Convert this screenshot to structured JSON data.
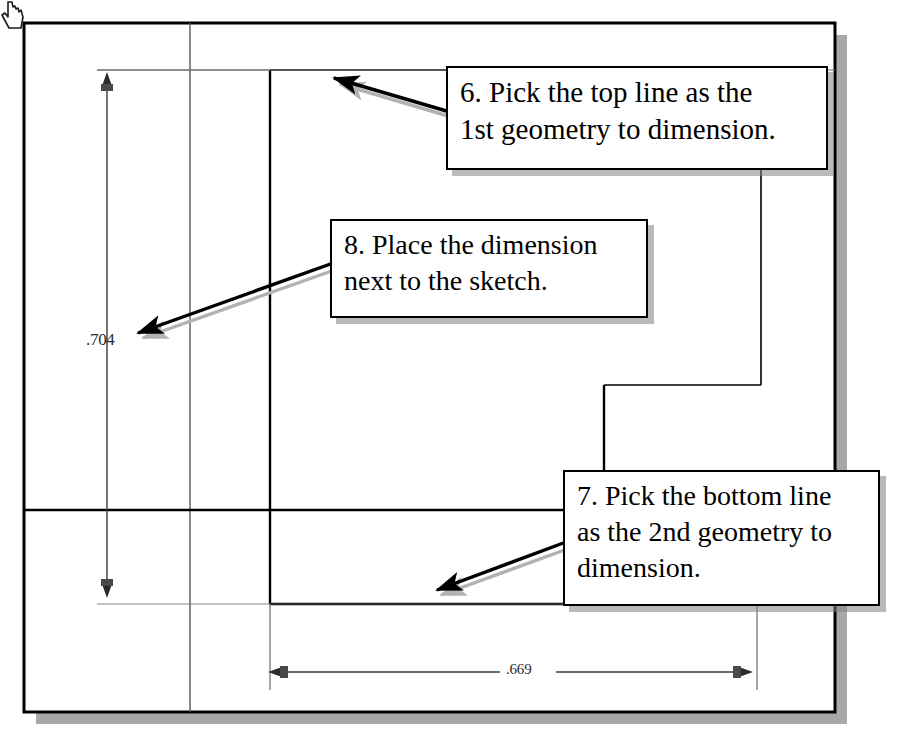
{
  "document": {
    "kind": "cad-sketch-tutorial-figure",
    "page_background": "#ffffff",
    "ink_color": "#000000",
    "shadow_color": "#9a9a9a"
  },
  "callouts": [
    {
      "id": "callout-6",
      "step": "6",
      "lines": [
        "6. Pick the top line as the",
        "1st geometry to dimension."
      ],
      "arrow_from": [
        450,
        112
      ],
      "arrow_to": [
        332,
        78
      ]
    },
    {
      "id": "callout-8",
      "step": "8",
      "lines": [
        "8. Place the dimension",
        "next to the sketch."
      ],
      "arrow_from": [
        336,
        262
      ],
      "arrow_to": [
        133,
        333
      ]
    },
    {
      "id": "callout-7",
      "step": "7",
      "lines": [
        "7. Pick the bottom line",
        "as the 2nd geometry to",
        "dimension."
      ],
      "arrow_from": [
        566,
        542
      ],
      "arrow_to": [
        432,
        590
      ]
    }
  ],
  "dimensions": {
    "vertical": {
      "value": ".704",
      "orientation": "vertical",
      "line_x": 107,
      "from_y": 78,
      "to_y": 592
    },
    "horizontal": {
      "value": ".669",
      "orientation": "horizontal",
      "line_y": 672,
      "from_x": 272,
      "to_x": 745
    }
  },
  "cursor": {
    "icon": "pointing-hand-cursor",
    "x": 101,
    "y": 345
  },
  "sketch": {
    "page_border": {
      "x": 24,
      "y": 23,
      "w": 811,
      "h": 689,
      "shadow_offset": 12
    },
    "reference_line_x": 190,
    "reference_line_y": 510,
    "profile_top_y": 70,
    "profile_left_x": 270,
    "profile_right_x": 761,
    "profile_step_y": 385,
    "profile_bottom_y": 604,
    "profile_outer_right_x": 835
  }
}
